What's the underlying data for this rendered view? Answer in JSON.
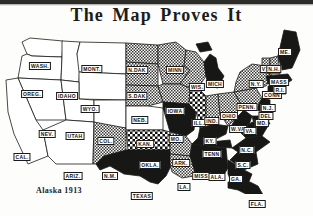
{
  "page": {
    "title": "The Map Proves It",
    "caption": "Alaska 1913",
    "ink_color": "#1c1c1a",
    "paper_color": "#fdfdfc",
    "shade_color": "#8d8d8a",
    "dark_color": "#171715"
  },
  "map_data": {
    "type": "map",
    "subject": "United States suffrage status map, 1913",
    "legend_implied": {
      "white": "no suffrage",
      "hatched": "partial / pending suffrage",
      "black": "full suffrage opposition / no vote"
    },
    "states": [
      {
        "abbr": "WASH.",
        "x": 40,
        "y": 42,
        "fill": "white"
      },
      {
        "abbr": "OREG.",
        "x": 32,
        "y": 70,
        "fill": "white"
      },
      {
        "abbr": "IDAHO",
        "x": 67,
        "y": 72,
        "fill": "white"
      },
      {
        "abbr": "MONT.",
        "x": 92,
        "y": 45,
        "fill": "white"
      },
      {
        "abbr": "WYO.",
        "x": 90,
        "y": 85,
        "fill": "white"
      },
      {
        "abbr": "NEV.",
        "x": 47,
        "y": 110,
        "fill": "white"
      },
      {
        "abbr": "UTAH",
        "x": 75,
        "y": 112,
        "fill": "white"
      },
      {
        "abbr": "CAL.",
        "x": 22,
        "y": 133,
        "fill": "white"
      },
      {
        "abbr": "COL.",
        "x": 106,
        "y": 117,
        "fill": "white"
      },
      {
        "abbr": "ARIZ.",
        "x": 73,
        "y": 152,
        "fill": "white"
      },
      {
        "abbr": "N.M.",
        "x": 110,
        "y": 152,
        "fill": "hatch"
      },
      {
        "abbr": "N.DAK",
        "x": 137,
        "y": 46,
        "fill": "hatch"
      },
      {
        "abbr": "S.DAK",
        "x": 137,
        "y": 72,
        "fill": "hatch"
      },
      {
        "abbr": "NEB.",
        "x": 140,
        "y": 96,
        "fill": "hatch"
      },
      {
        "abbr": "KAN.",
        "x": 145,
        "y": 120,
        "fill": "white"
      },
      {
        "abbr": "OKLA.",
        "x": 150,
        "y": 141,
        "fill": "check"
      },
      {
        "abbr": "TEXAS",
        "x": 142,
        "y": 172,
        "fill": "dark"
      },
      {
        "abbr": "MINN",
        "x": 175,
        "y": 46,
        "fill": "hatch"
      },
      {
        "abbr": "IOWA",
        "x": 175,
        "y": 87,
        "fill": "hatch"
      },
      {
        "abbr": "MO.",
        "x": 176,
        "y": 115,
        "fill": "dark"
      },
      {
        "abbr": "ARK.",
        "x": 181,
        "y": 139,
        "fill": "hatch"
      },
      {
        "abbr": "LA.",
        "x": 184,
        "y": 163,
        "fill": "hatch"
      },
      {
        "abbr": "WIS.",
        "x": 197,
        "y": 63,
        "fill": "hatch"
      },
      {
        "abbr": "ILL.",
        "x": 199,
        "y": 99,
        "fill": "check"
      },
      {
        "abbr": "MISS",
        "x": 201,
        "y": 152,
        "fill": "dark"
      },
      {
        "abbr": "MICH",
        "x": 215,
        "y": 60,
        "fill": "dark"
      },
      {
        "abbr": "IND.",
        "x": 212,
        "y": 97,
        "fill": "hatch"
      },
      {
        "abbr": "KY.",
        "x": 210,
        "y": 117,
        "fill": "dark"
      },
      {
        "abbr": "TENN",
        "x": 212,
        "y": 130,
        "fill": "dark"
      },
      {
        "abbr": "ALA.",
        "x": 217,
        "y": 153,
        "fill": "dark"
      },
      {
        "abbr": "OHIO",
        "x": 229,
        "y": 92,
        "fill": "hatch"
      },
      {
        "abbr": "W.VA",
        "x": 238,
        "y": 105,
        "fill": "dark"
      },
      {
        "abbr": "VA.",
        "x": 250,
        "y": 107,
        "fill": "dark"
      },
      {
        "abbr": "N.C.",
        "x": 247,
        "y": 126,
        "fill": "dark"
      },
      {
        "abbr": "S.C.",
        "x": 243,
        "y": 141,
        "fill": "dark"
      },
      {
        "abbr": "GA.",
        "x": 236,
        "y": 155,
        "fill": "dark"
      },
      {
        "abbr": "FLA.",
        "x": 257,
        "y": 180,
        "fill": "dark"
      },
      {
        "abbr": "PENN.",
        "x": 247,
        "y": 83,
        "fill": "hatch"
      },
      {
        "abbr": "N.Y.",
        "x": 256,
        "y": 60,
        "fill": "hatch"
      },
      {
        "abbr": "MD.",
        "x": 262,
        "y": 99,
        "fill": "dark"
      },
      {
        "abbr": "DEL",
        "x": 266,
        "y": 92,
        "fill": "dark"
      },
      {
        "abbr": "N.J.",
        "x": 268,
        "y": 84,
        "fill": "dark"
      },
      {
        "abbr": "CONN",
        "x": 272,
        "y": 71,
        "fill": "dark"
      },
      {
        "abbr": "R.I.",
        "x": 280,
        "y": 66,
        "fill": "dark"
      },
      {
        "abbr": "MASS",
        "x": 279,
        "y": 58,
        "fill": "dark"
      },
      {
        "abbr": "VT.",
        "x": 266,
        "y": 45,
        "fill": "hatch"
      },
      {
        "abbr": "N.H.",
        "x": 274,
        "y": 45,
        "fill": "hatch"
      },
      {
        "abbr": "ME.",
        "x": 285,
        "y": 28,
        "fill": "dark"
      }
    ]
  }
}
